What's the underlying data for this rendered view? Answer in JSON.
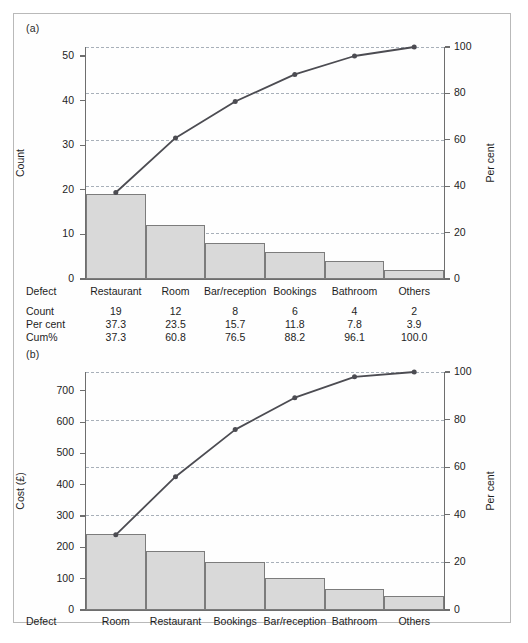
{
  "figure": {
    "panel_a_letter": "(a)",
    "panel_b_letter": "(b)"
  },
  "chart_data": [
    {
      "type": "bar",
      "panel": "(a)",
      "title": "",
      "xlabel": "Defect",
      "ylabel": "Count",
      "y2label": "Per cent",
      "ylim": [
        0,
        52
      ],
      "yticks": [
        0,
        10,
        20,
        30,
        40,
        50
      ],
      "y2lim": [
        0,
        100
      ],
      "y2ticks": [
        0,
        20,
        40,
        60,
        80,
        100
      ],
      "grid": true,
      "categories": [
        "Restaurant",
        "Room",
        "Bar/reception",
        "Bookings",
        "Bathroom",
        "Others"
      ],
      "values": [
        19,
        12,
        8,
        6,
        4,
        2
      ],
      "series": [
        {
          "name": "Count",
          "values": [
            19,
            12,
            8,
            6,
            4,
            2
          ]
        },
        {
          "name": "Cum%",
          "values": [
            37.3,
            60.8,
            76.5,
            88.2,
            96.1,
            100.0
          ]
        }
      ],
      "table": {
        "row_labels": [
          "Defect",
          "Count",
          "Per cent",
          "Cum%"
        ],
        "defect": [
          "Restaurant",
          "Room",
          "Bar/reception",
          "Bookings",
          "Bathroom",
          "Others"
        ],
        "count": [
          "19",
          "12",
          "8",
          "6",
          "4",
          "2"
        ],
        "per_cent": [
          "37.3",
          "23.5",
          "15.7",
          "11.8",
          "7.8",
          "3.9"
        ],
        "cum_pct": [
          "37.3",
          "60.8",
          "76.5",
          "88.2",
          "96.1",
          "100.0"
        ]
      }
    },
    {
      "type": "bar",
      "panel": "(b)",
      "title": "",
      "xlabel": "Defect",
      "ylabel": "Cost (£)",
      "y2label": "Per cent",
      "ylim": [
        0,
        760
      ],
      "yticks": [
        0,
        100,
        200,
        300,
        400,
        500,
        600,
        700
      ],
      "y2lim": [
        0,
        100
      ],
      "y2ticks": [
        0,
        20,
        40,
        60,
        80,
        100
      ],
      "grid": true,
      "categories": [
        "Room",
        "Restaurant",
        "Bookings",
        "Bar/reception",
        "Bathroom",
        "Others"
      ],
      "values": [
        243,
        188,
        152,
        103,
        68,
        44
      ],
      "series": [
        {
          "name": "Cost (£)",
          "values": [
            243,
            188,
            152,
            103,
            68,
            44
          ]
        },
        {
          "name": "Cum%",
          "values": [
            31.6,
            56.0,
            75.8,
            89.2,
            98.0,
            100.0
          ]
        }
      ],
      "table": {
        "row_labels": [
          "Defect"
        ],
        "defect": [
          "Room",
          "Restaurant",
          "Bookings",
          "Bar/reception",
          "Bathroom",
          "Others"
        ]
      }
    }
  ],
  "colors": {
    "bar_fill": "#d9d9d9",
    "bar_stroke": "#7c7c7c",
    "line": "#4c4c52",
    "grid": "#9aa3ad",
    "axis": "#6e6e6e",
    "text": "#1d1d1d",
    "frame": "#b9b9b9"
  }
}
